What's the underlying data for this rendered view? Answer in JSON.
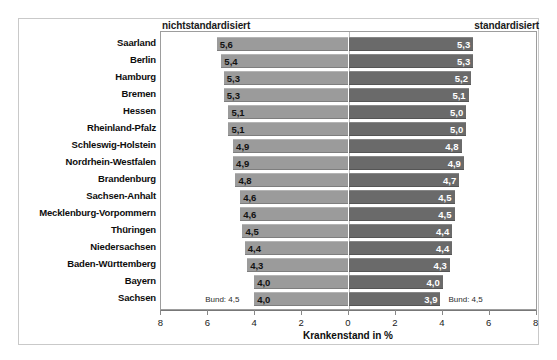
{
  "header": {
    "left_label": "nichtstandardisiert",
    "right_label": "standardisiert"
  },
  "annotations": {
    "bund_left": "Bund: 4,5",
    "bund_right": "Bund: 4,5"
  },
  "axis": {
    "title": "Krankenstand in %",
    "tick_labels": [
      "8",
      "6",
      "4",
      "2",
      "0",
      "2",
      "4",
      "6",
      "8"
    ],
    "tick_values": [
      -8,
      -6,
      -4,
      -2,
      0,
      2,
      4,
      6,
      8
    ]
  },
  "colors": {
    "bar_left": "#9b9b9b",
    "bar_right": "#6a6a6a",
    "value_left_text": "#121212",
    "value_right_text": "#ffffff",
    "frame": "#c9c9c9",
    "plot_border": "#9d9d9d"
  },
  "chart_data": {
    "type": "bar",
    "title": "",
    "subtitle": "",
    "xlabel": "Krankenstand in %",
    "ylabel": "",
    "orientation": "horizontal",
    "layout": "back-to-back bidirectional (butterfly)",
    "grid": false,
    "legend_position": "top (left header = nichtstandardisiert, right header = standardisiert)",
    "xlim": [
      -8,
      8
    ],
    "xticks": [
      -8,
      -6,
      -4,
      -2,
      0,
      2,
      4,
      6,
      8
    ],
    "xtick_labels": [
      "8",
      "6",
      "4",
      "2",
      "0",
      "2",
      "4",
      "6",
      "8"
    ],
    "categories": [
      "Saarland",
      "Berlin",
      "Hamburg",
      "Bremen",
      "Hessen",
      "Rheinland-Pfalz",
      "Schleswig-Holstein",
      "Nordrhein-Westfalen",
      "Brandenburg",
      "Sachsen-Anhalt",
      "Mecklenburg-Vorpommern",
      "Thüringen",
      "Niedersachsen",
      "Baden-Württemberg",
      "Bayern",
      "Sachsen"
    ],
    "series": [
      {
        "name": "nichtstandardisiert",
        "direction": "left",
        "color": "#9b9b9b",
        "values": [
          5.6,
          5.4,
          5.3,
          5.3,
          5.1,
          5.1,
          4.9,
          4.9,
          4.8,
          4.6,
          4.6,
          4.5,
          4.4,
          4.3,
          4.0,
          4.0
        ],
        "labels": [
          "5,6",
          "5,4",
          "5,3",
          "5,3",
          "5,1",
          "5,1",
          "4,9",
          "4,9",
          "4,8",
          "4,6",
          "4,6",
          "4,5",
          "4,4",
          "4,3",
          "4,0",
          "4,0"
        ],
        "reference_line_label": "Bund: 4,5",
        "reference_line_value": 4.5
      },
      {
        "name": "standardisiert",
        "direction": "right",
        "color": "#6a6a6a",
        "values": [
          5.3,
          5.3,
          5.2,
          5.1,
          5.0,
          5.0,
          4.8,
          4.9,
          4.7,
          4.5,
          4.5,
          4.4,
          4.4,
          4.3,
          4.0,
          3.9
        ],
        "labels": [
          "5,3",
          "5,3",
          "5,2",
          "5,1",
          "5,0",
          "5,0",
          "4,8",
          "4,9",
          "4,7",
          "4,5",
          "4,5",
          "4,4",
          "4,4",
          "4,3",
          "4,0",
          "3,9"
        ],
        "reference_line_label": "Bund: 4,5",
        "reference_line_value": 4.5
      }
    ]
  }
}
